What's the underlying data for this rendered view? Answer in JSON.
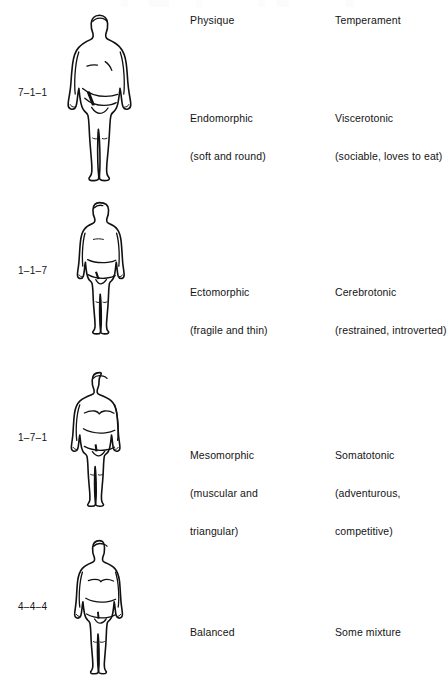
{
  "headers": {
    "physique": "Physique",
    "temperament": "Temperament"
  },
  "rows": [
    {
      "code": "7–1–1",
      "figure": "endomorph-figure",
      "physique_title": "Endomorphic",
      "physique_sub": "(soft and round)",
      "temperament_title": "Viscerotonic",
      "temperament_sub": "(sociable, loves to eat)"
    },
    {
      "code": "1–1–7",
      "figure": "ectomorph-figure",
      "physique_title": "Ectomorphic",
      "physique_sub": "(fragile and thin)",
      "temperament_title": "Cerebrotonic",
      "temperament_sub": "(restrained, introverted)"
    },
    {
      "code": "1–7–1",
      "figure": "mesomorph-figure",
      "physique_title": "Mesomorphic",
      "physique_sub": "(muscular and",
      "physique_sub2": "triangular)",
      "temperament_title": "Somatotonic",
      "temperament_sub": "(adventurous,",
      "temperament_sub2": "competitive)"
    },
    {
      "code": "4–4–4",
      "figure": "balanced-figure",
      "physique_title": "Balanced",
      "physique_sub": "",
      "temperament_title": "Some mixture",
      "temperament_sub": ""
    }
  ],
  "colors": {
    "background": "#ffffff",
    "ink": "#141414",
    "outline": "#111111"
  }
}
